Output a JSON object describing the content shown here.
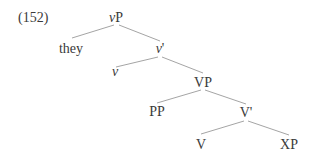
{
  "example_number": "(152)",
  "colors": {
    "text": "#3a3a3a",
    "edge": "#9a9a9a",
    "background": "#ffffff"
  },
  "tree": {
    "nodes": {
      "vP": {
        "label_italic": "v",
        "label_rest": "P"
      },
      "they": {
        "label": "they"
      },
      "vbar": {
        "label_italic": "v",
        "label_rest": "'"
      },
      "v": {
        "label_italic": "v"
      },
      "VP": {
        "label": "VP"
      },
      "PP": {
        "label": "PP"
      },
      "Vbar": {
        "label": "V'"
      },
      "V": {
        "label": "V"
      },
      "XP": {
        "label": "XP"
      }
    },
    "edges": [
      [
        "vP",
        "they"
      ],
      [
        "vP",
        "vbar"
      ],
      [
        "vbar",
        "v"
      ],
      [
        "vbar",
        "VP"
      ],
      [
        "VP",
        "PP"
      ],
      [
        "VP",
        "Vbar"
      ],
      [
        "Vbar",
        "V"
      ],
      [
        "Vbar",
        "XP"
      ]
    ]
  }
}
